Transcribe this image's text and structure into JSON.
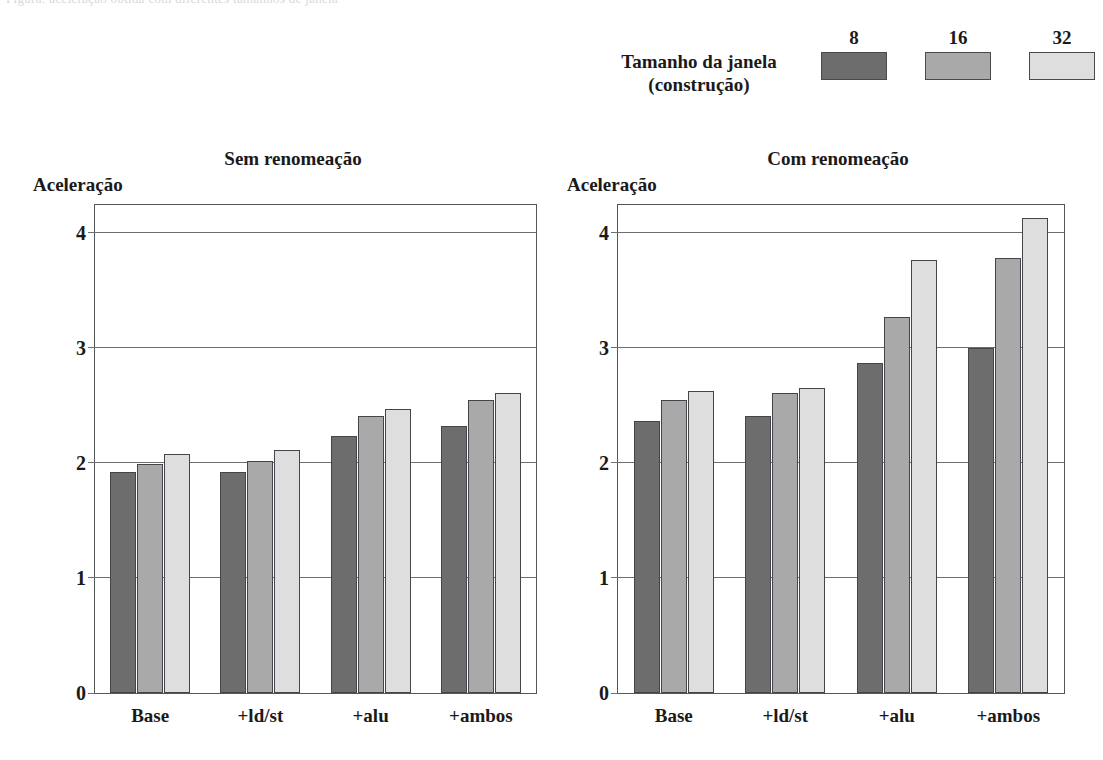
{
  "top_strip": {
    "ghost_text": "Figura: aceleração obtida com diferentes tamanhos de janela"
  },
  "legend": {
    "title_line1": "Tamanho da janela",
    "title_line2": "(construção)",
    "items": [
      {
        "key": "8",
        "color": "#6d6d6d"
      },
      {
        "key": "16",
        "color": "#a9a9a9"
      },
      {
        "key": "32",
        "color": "#dedede"
      }
    ]
  },
  "chart_data": [
    {
      "type": "bar",
      "title": "Sem renomeação",
      "ylabel": "Aceleração",
      "xlabel": "",
      "ylim": [
        0,
        4.24
      ],
      "yticks": [
        0,
        1,
        2,
        3,
        4
      ],
      "grid": true,
      "legend_position": "top-right (shared)",
      "categories": [
        "Base",
        "+ld/st",
        "+alu",
        "+ambos"
      ],
      "series": [
        {
          "name": "8",
          "values": [
            1.92,
            1.92,
            2.23,
            2.32
          ]
        },
        {
          "name": "16",
          "values": [
            1.99,
            2.02,
            2.41,
            2.55
          ]
        },
        {
          "name": "32",
          "values": [
            2.08,
            2.11,
            2.47,
            2.61
          ]
        }
      ]
    },
    {
      "type": "bar",
      "title": "Com renomeação",
      "ylabel": "Aceleração",
      "xlabel": "",
      "ylim": [
        0,
        4.24
      ],
      "yticks": [
        0,
        1,
        2,
        3,
        4
      ],
      "grid": true,
      "legend_position": "top-right (shared)",
      "categories": [
        "Base",
        "+ld/st",
        "+alu",
        "+ambos"
      ],
      "series": [
        {
          "name": "8",
          "values": [
            2.36,
            2.41,
            2.87,
            3.0
          ]
        },
        {
          "name": "16",
          "values": [
            2.55,
            2.61,
            3.27,
            3.78
          ]
        },
        {
          "name": "32",
          "values": [
            2.62,
            2.65,
            3.76,
            4.13
          ]
        }
      ]
    }
  ]
}
